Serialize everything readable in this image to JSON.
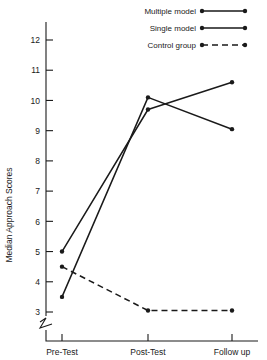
{
  "chart_data": {
    "type": "line",
    "title": "",
    "xlabel": "",
    "ylabel": "Median Approach Scores",
    "categories": [
      "Pre-Test",
      "Post-Test",
      "Follow up"
    ],
    "ylim": [
      3,
      12
    ],
    "yticks": [
      3,
      4,
      5,
      6,
      7,
      8,
      9,
      10,
      11,
      12
    ],
    "grid": false,
    "y_axis_break": true,
    "legend_position": "top-right",
    "series": [
      {
        "name": "Multiple model",
        "style": "solid",
        "values": [
          3.5,
          10.1,
          9.05
        ]
      },
      {
        "name": "Single model",
        "style": "solid",
        "values": [
          5.0,
          9.7,
          10.6
        ]
      },
      {
        "name": "Control group",
        "style": "dashed",
        "values": [
          4.5,
          3.05,
          3.05
        ]
      }
    ]
  },
  "axis": {
    "y_title": "Median Approach Scores",
    "y_tick_labels": [
      "12",
      "11",
      "10",
      "9",
      "8",
      "7",
      "6",
      "5",
      "4",
      "3"
    ],
    "x_tick_labels": [
      "Pre-Test",
      "Post-Test",
      "Follow up"
    ]
  },
  "legend": {
    "items": [
      {
        "label": "Multiple model",
        "style": "solid"
      },
      {
        "label": "Single model",
        "style": "solid"
      },
      {
        "label": "Control group",
        "style": "dashed"
      }
    ]
  },
  "colors": {
    "ink": "#1a1a1a",
    "background": "#ffffff"
  }
}
